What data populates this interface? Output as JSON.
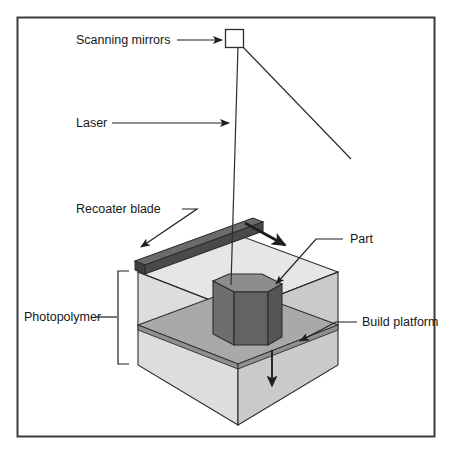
{
  "figure": {
    "border_color": "#3a3c40",
    "background": "#ffffff"
  },
  "labels": {
    "scanning_mirrors": "Scanning mirrors",
    "laser": "Laser",
    "recoater_blade": "Recoater blade",
    "photopolymer": "Photopolymer",
    "part": "Part",
    "build_platform": "Build platform"
  },
  "colors": {
    "line": "#2b2d30",
    "vat_front_face": "#d8d8d6",
    "vat_right_face": "#c9c9c7",
    "vat_top_resin": "#e2e2e0",
    "platform_top": "#a9a9a7",
    "platform_edge": "#8f8f8d",
    "part_top": "#8d8d8b",
    "part_left": "#6e6e6c",
    "part_right": "#5c5c5a",
    "blade_top": "#6b6b69",
    "blade_front": "#4a4a48",
    "mirror_box_fill": "#ffffff",
    "arrow": "#1d1f22"
  },
  "elements": {
    "scanning_mirrors_box": "small rectangle at top representing galvanometer scanning mirrors",
    "laser_beam_incoming": "diagonal beam arriving at mirrors from lower right",
    "laser_beam_outgoing": "near-vertical beam from mirrors down to part surface",
    "recoater_motion_arrow": "thick arrow showing recoater blade sweep direction",
    "platform_descend_arrow": "downward arrow showing build platform lowering",
    "photopolymer_bracket": "vertical bracket spanning resin depth"
  }
}
